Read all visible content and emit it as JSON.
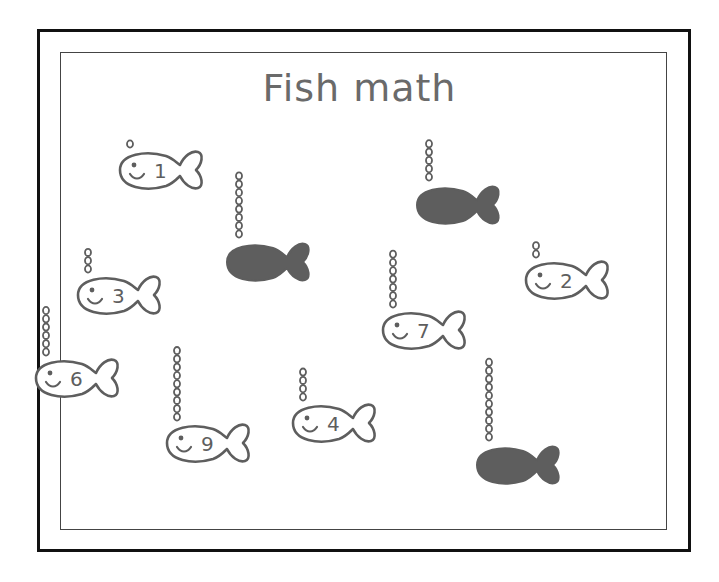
{
  "worksheet": {
    "title": "Fish math",
    "colors": {
      "stroke": "#5e5e5e",
      "dark_fish": "#5e5e5e",
      "border": "#111111",
      "background": "#ffffff"
    },
    "labeled_fish": [
      {
        "label": "1",
        "bubbles": 1,
        "x": 160,
        "y": 170
      },
      {
        "label": "3",
        "bubbles": 3,
        "x": 118,
        "y": 295
      },
      {
        "label": "6",
        "bubbles": 6,
        "x": 76,
        "y": 378
      },
      {
        "label": "9",
        "bubbles": 9,
        "x": 207,
        "y": 443
      },
      {
        "label": "4",
        "bubbles": 4,
        "x": 333,
        "y": 423
      },
      {
        "label": "7",
        "bubbles": 7,
        "x": 423,
        "y": 330
      },
      {
        "label": "2",
        "bubbles": 2,
        "x": 566,
        "y": 280
      }
    ],
    "dark_fish": [
      {
        "bubbles": 8,
        "x": 267,
        "y": 262
      },
      {
        "bubbles": 5,
        "x": 457,
        "y": 205
      },
      {
        "bubbles": 10,
        "x": 517,
        "y": 465
      }
    ]
  }
}
